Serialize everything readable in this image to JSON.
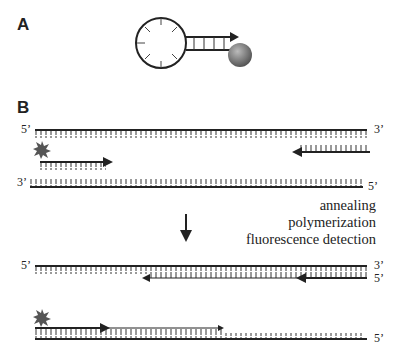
{
  "panels": {
    "a": {
      "label": "A",
      "elements": [
        "molecular-beacon-loop",
        "stem",
        "quencher"
      ]
    },
    "b": {
      "label": "B"
    }
  },
  "strands": {
    "top_5prime": "5’",
    "top_3prime": "3’",
    "bottom_3prime": "3’",
    "bottom_5prime": "5’",
    "product1_5prime": "5’",
    "product1_3prime": "3’",
    "product1_right_5prime": "5’",
    "product2_5prime": "5’"
  },
  "steps": [
    "annealing",
    "polymerization",
    "fluorescence detection"
  ],
  "colors": {
    "line": "#222222",
    "quencher": "#777777",
    "fluorophore": "#555555"
  }
}
